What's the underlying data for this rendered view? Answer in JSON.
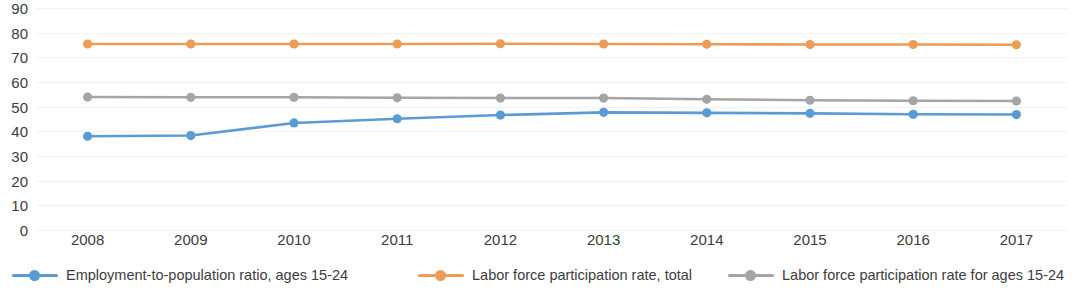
{
  "chart_data": {
    "type": "line",
    "title": "",
    "subtitle": "",
    "xlabel": "",
    "ylabel": "",
    "categories": [
      "2008",
      "2009",
      "2010",
      "2011",
      "2012",
      "2013",
      "2014",
      "2015",
      "2016",
      "2017"
    ],
    "ylim": [
      0,
      90
    ],
    "y_ticks": [
      "90",
      "80",
      "70",
      "60",
      "50",
      "40",
      "30",
      "20",
      "10",
      "0"
    ],
    "y_tick_values": [
      90,
      80,
      70,
      60,
      50,
      40,
      30,
      20,
      10,
      0
    ],
    "grid": true,
    "grid_axis": "y",
    "legend_position": "bottom",
    "markers": true,
    "series": [
      {
        "name": "Employment-to-population ratio, ages 15-24",
        "color": "#5B9BD5",
        "values": [
          38.0,
          38.3,
          43.4,
          45.1,
          46.6,
          47.7,
          47.5,
          47.3,
          46.9,
          46.8
        ]
      },
      {
        "name": "Labor force participation rate, total",
        "color": "#ED9C55",
        "values": [
          75.4,
          75.4,
          75.4,
          75.4,
          75.5,
          75.4,
          75.3,
          75.2,
          75.2,
          75.1
        ]
      },
      {
        "name": "Labor force participation rate for ages 15-24",
        "color": "#A5A5A5",
        "values": [
          53.9,
          53.8,
          53.8,
          53.6,
          53.5,
          53.5,
          53.0,
          52.6,
          52.4,
          52.3
        ]
      }
    ]
  },
  "legend": {
    "items": [
      {
        "label": "Employment-to-population ratio, ages 15-24",
        "color": "#5B9BD5"
      },
      {
        "label": "Labor force participation rate, total",
        "color": "#ED9C55"
      },
      {
        "label": "Labor force participation rate for ages 15-24",
        "color": "#A5A5A5"
      }
    ]
  }
}
